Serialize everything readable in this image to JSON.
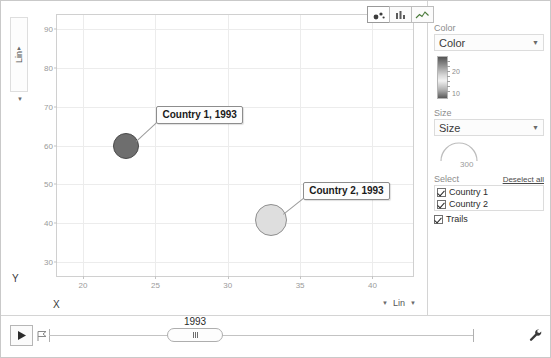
{
  "chart_data": {
    "type": "scatter",
    "title": "",
    "xlabel": "X",
    "ylabel": "Y",
    "xlim": [
      18.2,
      42.8
    ],
    "ylim": [
      26.5,
      93.5
    ],
    "xticks": [
      "20",
      "25",
      "30",
      "35",
      "40"
    ],
    "xtick_values": [
      20,
      25,
      30,
      35,
      40
    ],
    "yticks": [
      "90",
      "80",
      "70",
      "60",
      "50",
      "40",
      "30"
    ],
    "ytick_values": [
      90,
      80,
      70,
      60,
      50,
      40,
      30
    ],
    "grid": true,
    "legend": "none",
    "points": [
      {
        "label": "Country 1, 1993",
        "series": "Country 1",
        "x": 23,
        "y": 60,
        "size": 13,
        "color": "#6e6e6e",
        "border": "#4a4a4a"
      },
      {
        "label": "Country 2, 1993",
        "series": "Country 2",
        "x": 33,
        "y": 41,
        "size": 16,
        "color": "#dedede",
        "border": "#8f8f8f"
      }
    ]
  },
  "chart_type_buttons": [
    {
      "name": "bubble-chart",
      "active": true
    },
    {
      "name": "bar-chart",
      "active": false
    },
    {
      "name": "line-chart",
      "active": false
    }
  ],
  "axes": {
    "y_scale_label": "Lin",
    "x_scale_label": "Lin",
    "y_title": "Y",
    "x_title": "X"
  },
  "panel": {
    "color": {
      "section_label": "Color",
      "selected": "Color",
      "legend_ticks": [
        "20",
        "10"
      ]
    },
    "size": {
      "section_label": "Size",
      "selected": "Size",
      "max_value": "300"
    },
    "select": {
      "section_label": "Select",
      "deselect_all": "Deselect all",
      "items": [
        {
          "label": "Country 1",
          "checked": true
        },
        {
          "label": "Country 2",
          "checked": true
        }
      ],
      "trails": {
        "label": "Trails",
        "checked": true
      }
    }
  },
  "timeline": {
    "year": "1993",
    "play_label": "Play",
    "speed_label": "Speed"
  }
}
